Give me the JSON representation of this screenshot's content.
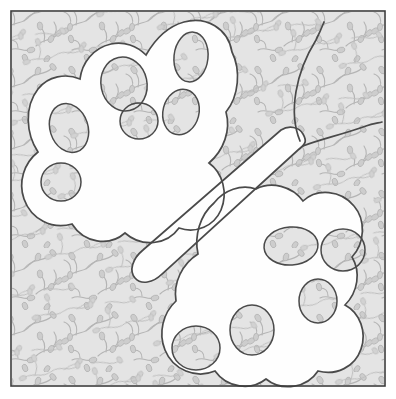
{
  "artwork": {
    "title": "Butterfly Applique Quilt Block",
    "subject": "butterfly",
    "style": "line-art applique pattern",
    "caption": ""
  },
  "colors": {
    "page_background": "#ffffff",
    "frame_stroke": "#3d3d3d",
    "fabric_background": "#e4e4e4",
    "fabric_motif": "#b4b4b4",
    "applique_fill": "#fefefe",
    "applique_stroke": "#4a4a4a",
    "cutout_stroke": "#4a4a4a"
  },
  "frame": {
    "x": 11,
    "y": 11,
    "width": 374,
    "height": 375,
    "stroke_width": 1.6
  },
  "fabric": {
    "motif_name": "vine-and-teardrop-leaf",
    "tile_size": 62,
    "stroke_width": 1.1
  },
  "butterfly": {
    "name": "butterfly-silhouette",
    "stroke_width": 1.7,
    "parts": [
      {
        "name": "upper-left-wing"
      },
      {
        "name": "lower-right-wing"
      },
      {
        "name": "body"
      },
      {
        "name": "antenna-upper"
      },
      {
        "name": "antenna-lower"
      }
    ],
    "body": {
      "name": "butterfly-body",
      "angle_deg": -28
    },
    "antennae": [
      {
        "name": "antenna-upper",
        "tip_x": 324,
        "tip_y": 22
      },
      {
        "name": "antenna-lower",
        "tip_x": 382,
        "tip_y": 122
      }
    ],
    "cutouts": [
      {
        "name": "cutout-ul-1",
        "cx": 69,
        "cy": 128,
        "rx": 19,
        "ry": 25,
        "rot": -18
      },
      {
        "name": "cutout-ul-2",
        "cx": 61,
        "cy": 182,
        "rx": 20,
        "ry": 19,
        "rot": 0
      },
      {
        "name": "cutout-ul-3",
        "cx": 124,
        "cy": 84,
        "rx": 23,
        "ry": 27,
        "rot": -12
      },
      {
        "name": "cutout-ul-4",
        "cx": 139,
        "cy": 121,
        "rx": 19,
        "ry": 18,
        "rot": 0
      },
      {
        "name": "cutout-ul-5",
        "cx": 191,
        "cy": 57,
        "rx": 17,
        "ry": 25,
        "rot": 6
      },
      {
        "name": "cutout-ul-6",
        "cx": 181,
        "cy": 112,
        "rx": 18,
        "ry": 23,
        "rot": 14
      },
      {
        "name": "cutout-lr-1",
        "cx": 291,
        "cy": 246,
        "rx": 27,
        "ry": 19,
        "rot": -4
      },
      {
        "name": "cutout-lr-2",
        "cx": 343,
        "cy": 250,
        "rx": 22,
        "ry": 21,
        "rot": 0
      },
      {
        "name": "cutout-lr-3",
        "cx": 318,
        "cy": 301,
        "rx": 19,
        "ry": 22,
        "rot": 0
      },
      {
        "name": "cutout-lr-4",
        "cx": 252,
        "cy": 330,
        "rx": 22,
        "ry": 25,
        "rot": 0
      },
      {
        "name": "cutout-lr-5",
        "cx": 196,
        "cy": 348,
        "rx": 24,
        "ry": 22,
        "rot": 0
      }
    ]
  }
}
